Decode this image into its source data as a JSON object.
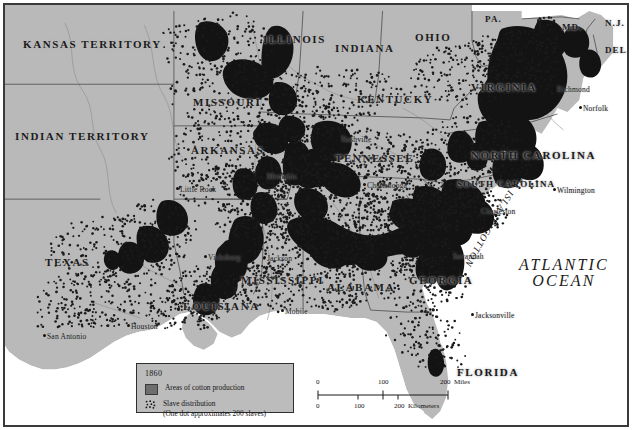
{
  "map": {
    "title": "Cotton Production and Slave Distribution, 1860",
    "colors": {
      "land": "#b9b9b9",
      "ocean": "#ffffff",
      "cotton_area": "#161616",
      "dot": "#1a1a1a",
      "border": "#3a3a3a",
      "state_line": "#5d5d5d",
      "legend_bg": "#bcbcbc"
    },
    "ocean_label_line1": "ATLANTIC",
    "ocean_label_line2": "OCEAN",
    "sea_island_label": "SEA ISLAND COTTON"
  },
  "legend": {
    "year": "1860",
    "cotton_swatch_name": "cotton-production-swatch",
    "cotton_label": "Areas of cotton production",
    "dots_swatch_name": "slave-distribution-dots-swatch",
    "slave_label_line1": "Slave distribution",
    "slave_label_line2": "(One dot approximates 200 slaves)"
  },
  "scale": {
    "miles": {
      "ticks": [
        "0",
        "100",
        "200"
      ],
      "unit": "Miles"
    },
    "kilometers": {
      "ticks": [
        "0",
        "100",
        "200"
      ],
      "unit": "Kilometers"
    }
  },
  "states": [
    {
      "name": "KANSAS TERRITORY",
      "x": 18,
      "y": 34,
      "size": "md"
    },
    {
      "name": "INDIAN TERRITORY",
      "x": 10,
      "y": 126,
      "size": "md"
    },
    {
      "name": "MISSOURI",
      "x": 188,
      "y": 92,
      "size": "md"
    },
    {
      "name": "ARKANSAS",
      "x": 186,
      "y": 140,
      "size": "md"
    },
    {
      "name": "TEXAS",
      "x": 40,
      "y": 252,
      "size": "md"
    },
    {
      "name": "LOUISIANA",
      "x": 178,
      "y": 296,
      "size": "md"
    },
    {
      "name": "MISSISSIPPI",
      "x": 236,
      "y": 270,
      "size": "md"
    },
    {
      "name": "ALABAMA",
      "x": 322,
      "y": 277,
      "size": "md"
    },
    {
      "name": "GEORGIA",
      "x": 404,
      "y": 270,
      "size": "md"
    },
    {
      "name": "FLORIDA",
      "x": 452,
      "y": 362,
      "size": "md"
    },
    {
      "name": "TENNESSEE",
      "x": 330,
      "y": 148,
      "size": "md"
    },
    {
      "name": "KENTUCKY",
      "x": 352,
      "y": 89,
      "size": "md"
    },
    {
      "name": "ILLINOIS",
      "x": 258,
      "y": 29,
      "size": "md"
    },
    {
      "name": "INDIANA",
      "x": 330,
      "y": 38,
      "size": "md"
    },
    {
      "name": "OHIO",
      "x": 410,
      "y": 27,
      "size": "md"
    },
    {
      "name": "VIRGINIA",
      "x": 466,
      "y": 77,
      "size": "md"
    },
    {
      "name": "NORTH CAROLINA",
      "x": 466,
      "y": 145,
      "size": "md"
    },
    {
      "name": "SOUTH CAROLINA",
      "x": 452,
      "y": 175,
      "size": "sm"
    },
    {
      "name": "PA.",
      "x": 480,
      "y": 10,
      "size": "sm"
    },
    {
      "name": "MD.",
      "x": 557,
      "y": 18,
      "size": "sm"
    },
    {
      "name": "N.J.",
      "x": 600,
      "y": 14,
      "size": "sm"
    },
    {
      "name": "DEL.",
      "x": 600,
      "y": 41,
      "size": "sm"
    }
  ],
  "cities": [
    {
      "name": "Norfolk",
      "x": 578,
      "y": 100
    },
    {
      "name": "Richmond",
      "x": 552,
      "y": 81
    },
    {
      "name": "Wilmington",
      "x": 552,
      "y": 182
    },
    {
      "name": "Charleston",
      "x": 476,
      "y": 203
    },
    {
      "name": "Savannah",
      "x": 448,
      "y": 248
    },
    {
      "name": "Jacksonville",
      "x": 470,
      "y": 307
    },
    {
      "name": "Mobile",
      "x": 280,
      "y": 303
    },
    {
      "name": "Jackson",
      "x": 262,
      "y": 250
    },
    {
      "name": "Vicksburg",
      "x": 203,
      "y": 249
    },
    {
      "name": "Houston",
      "x": 126,
      "y": 318
    },
    {
      "name": "San Antonio",
      "x": 42,
      "y": 328
    },
    {
      "name": "Little Rock",
      "x": 175,
      "y": 181
    },
    {
      "name": "Memphis",
      "x": 262,
      "y": 168
    },
    {
      "name": "Nashville",
      "x": 336,
      "y": 131
    },
    {
      "name": "Chattanooga",
      "x": 362,
      "y": 177
    }
  ]
}
